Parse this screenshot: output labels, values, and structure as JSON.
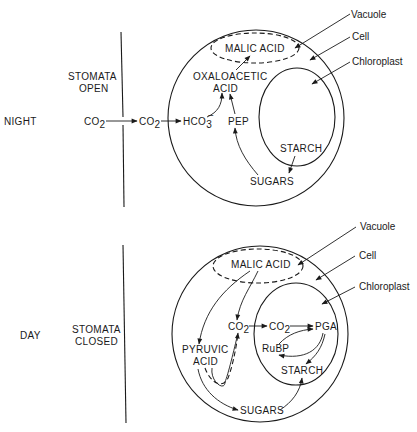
{
  "panels": {
    "night": {
      "time_label": "NIGHT",
      "stomata_line1": "STOMATA",
      "stomata_line2": "OPEN",
      "co2_outside": "CO",
      "co2_outside_sub": "2",
      "co2_inside": "CO",
      "co2_inside_sub": "2",
      "bicarbonate": "HCO",
      "bicarbonate_sub": "3",
      "bicarbonate_sup": "−",
      "malic_acid": "MALIC ACID",
      "oxaloacetic_line1": "OXALOACETIC",
      "oxaloacetic_line2": "ACID",
      "pep": "PEP",
      "starch": "STARCH",
      "sugars": "SUGARS",
      "callouts": {
        "vacuole": "Vacuole",
        "cell": "Cell",
        "chloroplast": "Chloroplast"
      }
    },
    "day": {
      "time_label": "DAY",
      "stomata_line1": "STOMATA",
      "stomata_line2": "CLOSED",
      "malic_acid": "MALIC ACID",
      "co2_cytoplasm": "CO",
      "co2_cytoplasm_sub": "2",
      "co2_chloroplast": "CO",
      "co2_chloroplast_sub": "2",
      "pga": "PGA",
      "rubp": "RuBP",
      "pyruvic_line1": "PYRUVIC",
      "pyruvic_line2": "ACID",
      "starch": "STARCH",
      "sugars": "SUGARS",
      "callouts": {
        "vacuole": "Vacuole",
        "cell": "Cell",
        "chloroplast": "Chloroplast"
      }
    }
  },
  "colors": {
    "ink": "#1a1a1a",
    "background": "#ffffff"
  }
}
